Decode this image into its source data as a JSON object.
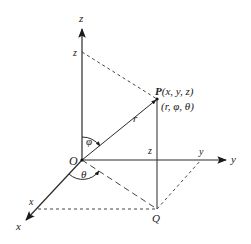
{
  "diagram": {
    "colors": {
      "line": "#2a2a2a",
      "background": "#ffffff"
    },
    "origin": {
      "label": "O"
    },
    "axes": {
      "z": {
        "label": "z",
        "tick_label": "z"
      },
      "y": {
        "label": "y",
        "tick_label": "y"
      },
      "x": {
        "label": "x",
        "tick_label": "x"
      }
    },
    "point_p": {
      "label_bold": "P",
      "cartesian": "(x, y, z)",
      "spherical": "(r, φ, θ)"
    },
    "point_q": {
      "label": "Q"
    },
    "segment_labels": {
      "radius": "r",
      "height": "z"
    },
    "angles": {
      "polar": "φ",
      "azimuth": "θ"
    }
  }
}
